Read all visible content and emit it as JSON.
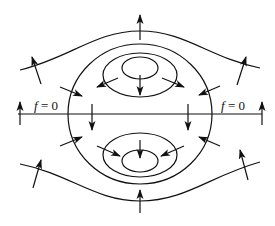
{
  "diagram": {
    "type": "field-line-diagram",
    "colors": {
      "stroke": "#111111",
      "background": "#ffffff"
    },
    "labels": {
      "left": {
        "var": "f",
        "rest": " = 0"
      },
      "right": {
        "var": "f",
        "rest": " = 0"
      }
    },
    "axis_line": {
      "x1": 18,
      "x2": 262,
      "y": 114
    },
    "curves": {
      "outer_wave_top": "M 20 70 C 70 58, 95 31, 140 31 C 185 31, 210 58, 260 68",
      "outer_wave_bottom": "M 20 164 C 70 174, 95 201, 140 201 C 185 201, 210 176, 260 162",
      "big_circle": {
        "cx": 140,
        "cy": 114,
        "rx": 72,
        "ry": 70
      },
      "upper_middle_ellipse": {
        "cx": 140,
        "cy": 75,
        "rx": 37,
        "ry": 22
      },
      "upper_inner_ellipse": {
        "cx": 140,
        "cy": 68,
        "rx": 18,
        "ry": 11
      },
      "lower_middle_ellipse": {
        "cx": 140,
        "cy": 155,
        "rx": 37,
        "ry": 22
      },
      "lower_inner_ellipse": {
        "cx": 140,
        "cy": 161,
        "rx": 18,
        "ry": 11
      }
    },
    "arrows": [
      {
        "name": "top-center-up",
        "x1": 140,
        "y1": 40,
        "x2": 140,
        "y2": 15
      },
      {
        "name": "bottom-center-up",
        "x1": 140,
        "y1": 213,
        "x2": 140,
        "y2": 190
      },
      {
        "name": "top-left-wave",
        "x1": 41,
        "y1": 84,
        "x2": 32,
        "y2": 57
      },
      {
        "name": "top-right-wave",
        "x1": 237,
        "y1": 85,
        "x2": 246,
        "y2": 57
      },
      {
        "name": "bottom-left-wave",
        "x1": 33,
        "y1": 188,
        "x2": 41,
        "y2": 160
      },
      {
        "name": "bottom-right-wave",
        "x1": 248,
        "y1": 180,
        "x2": 240,
        "y2": 150
      },
      {
        "name": "axis-far-left-up",
        "x1": 20,
        "y1": 125,
        "x2": 20,
        "y2": 102
      },
      {
        "name": "axis-far-right-up",
        "x1": 262,
        "y1": 125,
        "x2": 262,
        "y2": 102
      },
      {
        "name": "axis-inner-left-down",
        "x1": 92,
        "y1": 104,
        "x2": 92,
        "y2": 130
      },
      {
        "name": "axis-inner-right-down",
        "x1": 188,
        "y1": 104,
        "x2": 188,
        "y2": 130
      },
      {
        "name": "circle-upper-left-in",
        "x1": 60,
        "y1": 87,
        "x2": 82,
        "y2": 96
      },
      {
        "name": "circle-upper-right-in",
        "x1": 220,
        "y1": 86,
        "x2": 199,
        "y2": 95
      },
      {
        "name": "inner-upper-left-out",
        "x1": 118,
        "y1": 78,
        "x2": 97,
        "y2": 87
      },
      {
        "name": "inner-upper-right-out",
        "x1": 162,
        "y1": 78,
        "x2": 184,
        "y2": 87
      },
      {
        "name": "inner-upper-center-down",
        "x1": 140,
        "y1": 75,
        "x2": 140,
        "y2": 95
      },
      {
        "name": "circle-lower-left-in",
        "x1": 60,
        "y1": 146,
        "x2": 82,
        "y2": 137
      },
      {
        "name": "circle-lower-right-in",
        "x1": 220,
        "y1": 146,
        "x2": 199,
        "y2": 137
      },
      {
        "name": "inner-lower-left-in",
        "x1": 97,
        "y1": 146,
        "x2": 120,
        "y2": 156
      },
      {
        "name": "inner-lower-right-in",
        "x1": 184,
        "y1": 146,
        "x2": 161,
        "y2": 156
      },
      {
        "name": "inner-lower-center-down",
        "x1": 140,
        "y1": 140,
        "x2": 140,
        "y2": 158
      }
    ]
  }
}
